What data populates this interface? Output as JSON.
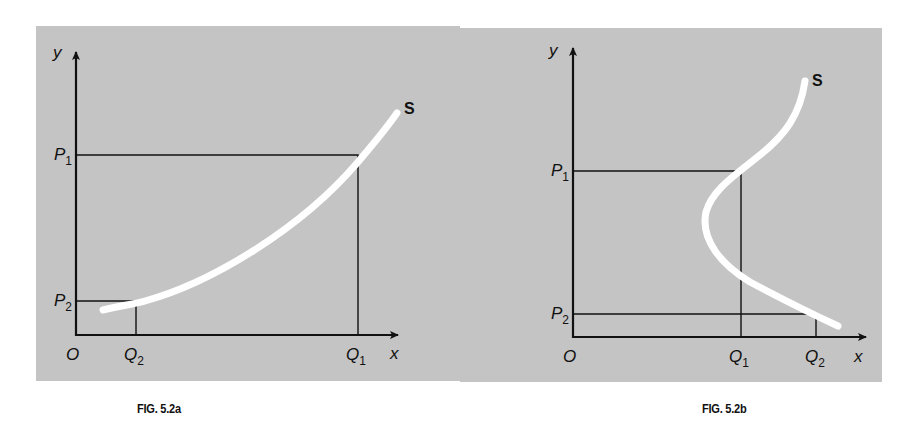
{
  "figures": [
    {
      "id": "fig_a",
      "caption": "FIG. 5.2a",
      "axis_x_label": "x",
      "axis_y_label": "y",
      "origin_label": "O",
      "curve_label": "S",
      "points": {
        "P1": {
          "label": "P",
          "sub": "1"
        },
        "P2": {
          "label": "P",
          "sub": "2"
        },
        "Q1": {
          "label": "Q",
          "sub": "1"
        },
        "Q2": {
          "label": "Q",
          "sub": "2"
        }
      },
      "description": "Upward-sloping supply curve S; price P1 corresponds to quantity Q1, price P2 (lower) to quantity Q2 (lower)"
    },
    {
      "id": "fig_b",
      "caption": "FIG. 5.2b",
      "axis_x_label": "x",
      "axis_y_label": "y",
      "origin_label": "O",
      "curve_label": "S",
      "points": {
        "P1": {
          "label": "P",
          "sub": "1"
        },
        "P2": {
          "label": "P",
          "sub": "2"
        },
        "Q1": {
          "label": "Q",
          "sub": "1"
        },
        "Q2": {
          "label": "Q",
          "sub": "2"
        }
      },
      "description": "Backward-bending supply curve S; higher price P1 corresponds to smaller quantity Q1, lower price P2 to larger quantity Q2"
    }
  ],
  "colors": {
    "panel_background": "#c4c4c4",
    "axis_line": "#111111",
    "curve": "#ffffff"
  }
}
